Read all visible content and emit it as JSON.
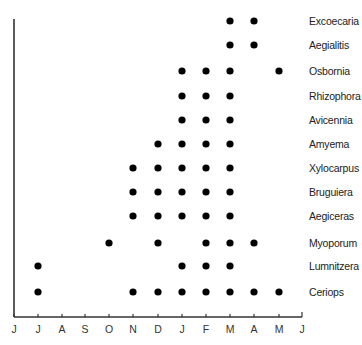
{
  "chart_data": {
    "type": "scatter",
    "title": "",
    "xlabel": "",
    "ylabel": "",
    "grid": false,
    "legend": null,
    "x_ticks": [
      "J",
      "J",
      "A",
      "S",
      "O",
      "N",
      "D",
      "J",
      "F",
      "M",
      "A",
      "M",
      "J"
    ],
    "x_tick_meaning": [
      "Jun",
      "Jul",
      "Aug",
      "Sep",
      "Oct",
      "Nov",
      "Dec",
      "Jan",
      "Feb",
      "Mar",
      "Apr",
      "May",
      "Jun"
    ],
    "species": [
      {
        "name": "Excoecaria",
        "months": [
          9,
          10
        ]
      },
      {
        "name": "Aegialitis",
        "months": [
          9,
          10
        ]
      },
      {
        "name": "Osbornia",
        "months": [
          7,
          8,
          9,
          11
        ]
      },
      {
        "name": "Rhizophora",
        "months": [
          7,
          8,
          9
        ]
      },
      {
        "name": "Avicennia",
        "months": [
          7,
          8,
          9
        ]
      },
      {
        "name": "Amyema",
        "months": [
          6,
          7,
          8,
          9
        ]
      },
      {
        "name": "Xylocarpus",
        "months": [
          5,
          6,
          7,
          8,
          9
        ]
      },
      {
        "name": "Bruguiera",
        "months": [
          5,
          6,
          7,
          8,
          9
        ]
      },
      {
        "name": "Aegiceras",
        "months": [
          5,
          6,
          7,
          8,
          9
        ]
      },
      {
        "name": "Myoporum",
        "months": [
          4,
          6,
          8,
          9,
          10
        ]
      },
      {
        "name": "Lumnitzera",
        "months": [
          1,
          7,
          8,
          9
        ]
      },
      {
        "name": "Ceriops",
        "months": [
          1,
          5,
          6,
          7,
          8,
          9,
          10,
          11
        ]
      }
    ],
    "months_index_note": "month indices refer to positions in x_ticks (0 = first J)"
  },
  "layout": {
    "axis_color": "#333333",
    "dot_color": "#000000",
    "x_tick_px": [
      14,
      38,
      62,
      85,
      109,
      133,
      158,
      182,
      206,
      230,
      254,
      279,
      302
    ],
    "row_y_px": [
      21,
      45,
      71,
      96,
      120,
      144,
      168,
      192,
      216,
      243,
      266,
      292
    ]
  }
}
